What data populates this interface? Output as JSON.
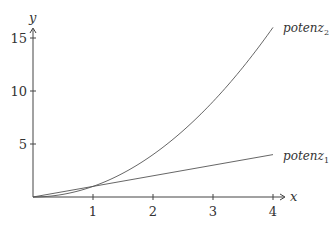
{
  "chart_data": {
    "type": "line",
    "title": "",
    "xlabel": "x",
    "ylabel": "y",
    "xlim": [
      0,
      4
    ],
    "ylim": [
      0,
      16
    ],
    "grid": false,
    "legend_position": "inline-labels at line ends",
    "x_ticks": [
      "1",
      "2",
      "3",
      "4"
    ],
    "y_ticks": [
      "5",
      "10",
      "15"
    ],
    "series": [
      {
        "name": "potenz_1",
        "label_base": "potenz",
        "label_sub": "1",
        "function": "x",
        "x": [
          0,
          1,
          2,
          3,
          4
        ],
        "values": [
          0,
          1,
          2,
          3,
          4
        ]
      },
      {
        "name": "potenz_2",
        "label_base": "potenz",
        "label_sub": "2",
        "function": "x^2",
        "x": [
          0,
          0.5,
          1,
          1.5,
          2,
          2.5,
          3,
          3.5,
          4
        ],
        "values": [
          0,
          0.25,
          1,
          2.25,
          4,
          6.25,
          9,
          12.25,
          16
        ]
      }
    ]
  }
}
